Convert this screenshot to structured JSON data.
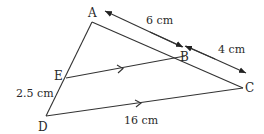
{
  "diagram": {
    "type": "geometry-triangle-parallel-lines",
    "points": {
      "A": {
        "label": "A",
        "x": 92,
        "y": 22
      },
      "B": {
        "label": "B",
        "x": 185,
        "y": 56
      },
      "C": {
        "label": "C",
        "x": 243,
        "y": 88
      },
      "D": {
        "label": "D",
        "x": 46,
        "y": 116
      },
      "E": {
        "label": "E",
        "x": 66,
        "y": 78
      }
    },
    "segments": [
      "AC",
      "AD",
      "EB",
      "DC"
    ],
    "parallel": [
      "EB",
      "DC"
    ],
    "measurements": {
      "AB": "6 cm",
      "BC": "4 cm",
      "ED": "2.5 cm",
      "DC": "16 cm"
    },
    "colors": {
      "line": "#333333",
      "text": "#2a2a2a",
      "background": "#ffffff"
    }
  }
}
